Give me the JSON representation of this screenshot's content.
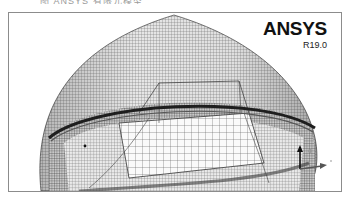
{
  "caption": {
    "text": "图 ANSYS 有限元模型"
  },
  "viewport": {
    "product": "ANSYS",
    "release": "R19.0",
    "background": "#ffffff",
    "mesh_color": "#333333",
    "view": "wireframe-dome-mesh"
  },
  "triad": {
    "axes": [
      {
        "label": "Z",
        "direction": "up"
      },
      {
        "label": "Y",
        "direction": "right"
      },
      {
        "label": "X",
        "direction": "out-of-plane"
      }
    ],
    "icon": "coordinate-triad-icon"
  }
}
